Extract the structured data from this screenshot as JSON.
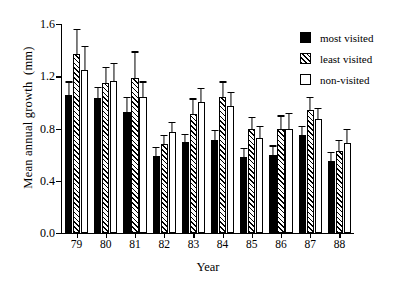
{
  "chart_data": {
    "type": "bar",
    "title": "",
    "xlabel": "Year",
    "ylabel": "Mean annual growth  (mm)",
    "categories": [
      "79",
      "80",
      "81",
      "82",
      "83",
      "84",
      "85",
      "86",
      "87",
      "88"
    ],
    "ylim": [
      0.0,
      1.6
    ],
    "yticks": [
      "0.0",
      "0.4",
      "0.8",
      "1.2",
      "1.6"
    ],
    "ytick_values": [
      0.0,
      0.4,
      0.8,
      1.2,
      1.6
    ],
    "grid": false,
    "legend_position": "top-right",
    "series": [
      {
        "name": "most visited",
        "fill": "solid-black",
        "values": [
          1.06,
          1.03,
          0.93,
          0.59,
          0.7,
          0.71,
          0.58,
          0.6,
          0.75,
          0.55
        ],
        "errors": [
          0.1,
          0.09,
          0.11,
          0.07,
          0.06,
          0.08,
          0.07,
          0.07,
          0.07,
          0.07
        ]
      },
      {
        "name": "least visited",
        "fill": "hatched",
        "values": [
          1.37,
          1.15,
          1.19,
          0.68,
          0.91,
          1.04,
          0.8,
          0.8,
          0.94,
          0.63
        ],
        "errors": [
          0.19,
          0.12,
          0.2,
          0.07,
          0.12,
          0.12,
          0.09,
          0.1,
          0.1,
          0.08
        ]
      },
      {
        "name": "non-visited",
        "fill": "white",
        "values": [
          1.25,
          1.16,
          1.04,
          0.77,
          1.0,
          0.97,
          0.73,
          0.8,
          0.87,
          0.69
        ],
        "errors": [
          0.18,
          0.14,
          0.12,
          0.08,
          0.11,
          0.11,
          0.09,
          0.12,
          0.09,
          0.11
        ]
      }
    ]
  },
  "legend": {
    "items": [
      {
        "label": "most visited",
        "swatch": "solid-black-swatch"
      },
      {
        "label": "least visited",
        "swatch": "hatched-swatch"
      },
      {
        "label": "non-visited",
        "swatch": "white-swatch"
      }
    ]
  }
}
